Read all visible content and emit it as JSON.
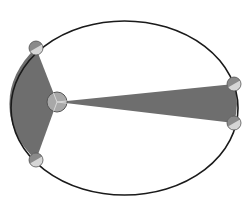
{
  "diagram": {
    "type": "kepler-second-law-equal-areas",
    "colors": {
      "background": "#ffffff",
      "orbit_stroke": "#1a1a1a",
      "swept_area_fill": "#6e6e6e",
      "sun_fill": "#a8a8a8",
      "sun_stroke": "#555555",
      "planet_light": "#d6d6d6",
      "planet_dark": "#8a8a8a",
      "planet_stroke": "#555555"
    },
    "orbit": {
      "cx": 124.5,
      "cy": 108,
      "rx": 113.5,
      "ry": 87
    },
    "sun": {
      "cx": 57,
      "cy": 102,
      "r": 10
    },
    "swept_areas": [
      {
        "name": "near-perihelion",
        "from": [
          36,
          48
        ],
        "to": [
          36,
          160
        ]
      },
      {
        "name": "near-aphelion",
        "from": [
          234,
          84
        ],
        "to": [
          234,
          123
        ]
      }
    ],
    "planets": [
      {
        "name": "planet-perihelion-start",
        "cx": 36,
        "cy": 48,
        "r": 7
      },
      {
        "name": "planet-perihelion-end",
        "cx": 36,
        "cy": 160,
        "r": 7
      },
      {
        "name": "planet-aphelion-start",
        "cx": 234,
        "cy": 84,
        "r": 7
      },
      {
        "name": "planet-aphelion-end",
        "cx": 234,
        "cy": 123,
        "r": 7
      }
    ]
  }
}
